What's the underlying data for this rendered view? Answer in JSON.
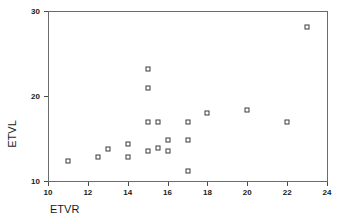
{
  "chart_data": {
    "type": "scatter",
    "title": "",
    "xlabel": "ETVR",
    "ylabel": "ETVL",
    "xlim": [
      10,
      24
    ],
    "ylim": [
      10,
      30
    ],
    "xticks": [
      10,
      12,
      14,
      16,
      18,
      20,
      22,
      24
    ],
    "yticks": [
      10,
      20,
      30
    ],
    "xtick_labels": [
      "10",
      "12",
      "14",
      "16",
      "18",
      "20",
      "22",
      "24"
    ],
    "ytick_labels": [
      "10",
      "20",
      "30"
    ],
    "grid": false,
    "legend": null,
    "marker": "open-square",
    "marker_color": "#3a3a3a",
    "points": [
      {
        "x": 11.0,
        "y": 12.3
      },
      {
        "x": 12.5,
        "y": 12.8
      },
      {
        "x": 13.0,
        "y": 13.8
      },
      {
        "x": 14.0,
        "y": 14.3
      },
      {
        "x": 14.0,
        "y": 12.8
      },
      {
        "x": 15.0,
        "y": 23.2
      },
      {
        "x": 15.0,
        "y": 20.9
      },
      {
        "x": 15.0,
        "y": 17.0
      },
      {
        "x": 15.0,
        "y": 13.5
      },
      {
        "x": 15.5,
        "y": 17.0
      },
      {
        "x": 15.5,
        "y": 13.9
      },
      {
        "x": 16.0,
        "y": 14.8
      },
      {
        "x": 16.0,
        "y": 13.5
      },
      {
        "x": 17.0,
        "y": 17.0
      },
      {
        "x": 17.0,
        "y": 14.8
      },
      {
        "x": 17.0,
        "y": 11.2
      },
      {
        "x": 18.0,
        "y": 18.0
      },
      {
        "x": 20.0,
        "y": 18.4
      },
      {
        "x": 22.0,
        "y": 17.0
      },
      {
        "x": 23.0,
        "y": 28.1
      }
    ]
  }
}
